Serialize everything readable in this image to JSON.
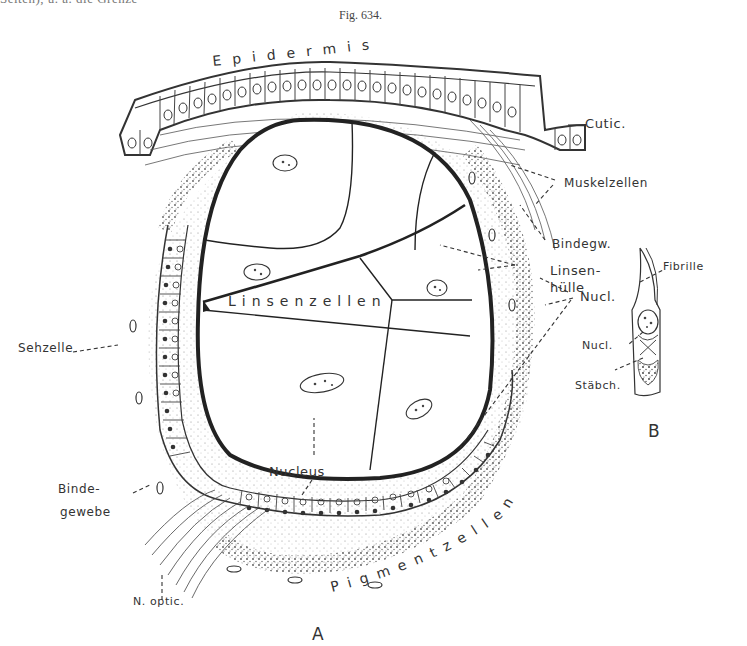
{
  "page": {
    "header_fragment": "Seiten), u. a. die Grenze",
    "figure_caption": "Fig. 634."
  },
  "figure_a": {
    "panel_label": "A",
    "labels": {
      "epidermis": "Epidermis",
      "cutic": "Cutic.",
      "muskelzellen": "Muskelzellen",
      "bindegw": "Bindegw.",
      "linsenhuelle_1": "Linsen-",
      "linsenhuelle_2": "hülle",
      "nucl": "Nucl.",
      "linsenzellen": "Linsenzellen",
      "sehzelle": "Sehzelle",
      "nucleus": "Nucleus",
      "bindegewebe_1": "Binde-",
      "bindegewebe_2": "gewebe",
      "n_optic": "N. optic.",
      "pigmentzellen": "Pigmentzellen"
    }
  },
  "figure_b": {
    "panel_label": "B",
    "labels": {
      "fibrille": "Fibrille",
      "nucl": "Nucl.",
      "staebch": "Stäbch."
    }
  }
}
